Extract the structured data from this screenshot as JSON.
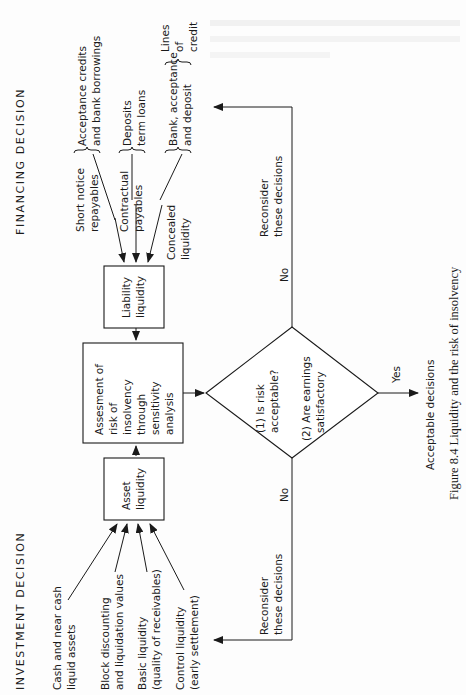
{
  "figure": {
    "caption": "Figure 8.4 Liquidity and the risk of insolvency",
    "headers": {
      "financing": "FINANCING  DECISION",
      "investment": "INVESTMENT  DECISION"
    },
    "boxes": {
      "liability": [
        "Liability",
        "liquidity"
      ],
      "assessment": [
        "Assesment of",
        "risk of",
        "insolvency",
        "through",
        "sensitivity",
        "analysis"
      ],
      "asset": [
        "Asset",
        "liquidity"
      ]
    },
    "decision": {
      "q1": [
        "(1) Is risk",
        "acceptable?"
      ],
      "q2": [
        "(2) Are earnings",
        "satisfactory"
      ]
    },
    "branches": {
      "no_top": "No",
      "no_bottom": "No",
      "yes": "Yes",
      "reconsider_top": [
        "Reconsider",
        "these decisions"
      ],
      "reconsider_bottom": [
        "Reconsider",
        "these decisions"
      ],
      "acceptable": "Acceptable decisions"
    },
    "financing_sources": {
      "short_notice": [
        "Short notice",
        "repayables"
      ],
      "contractual": [
        "Contractual",
        "payables"
      ],
      "concealed": [
        "Concealed",
        "liquidity"
      ],
      "acceptance": [
        "Acceptance credits",
        "and bank borrowings"
      ],
      "deposits": [
        "Deposits",
        "term loans"
      ],
      "bank_acceptance": [
        "Bank, acceptance",
        "and deposit"
      ],
      "lines_of_credit": [
        "Lines",
        "of",
        "credit"
      ]
    },
    "investment_sources": {
      "cash": [
        "Cash and near cash",
        "liquid assets"
      ],
      "block": [
        "Block discounting",
        "and liquidation values"
      ],
      "basic": [
        "Basic liquidity",
        "(quality of receivables)"
      ],
      "control": [
        "Control liquidity",
        "(early settlement)"
      ]
    }
  }
}
